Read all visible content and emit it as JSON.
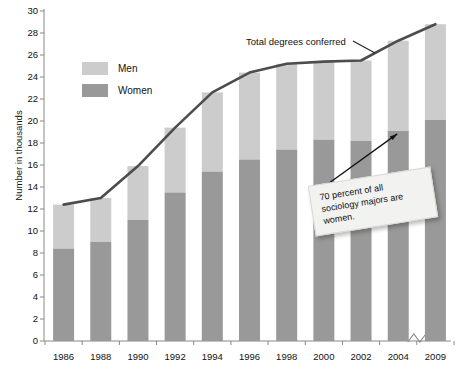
{
  "chart_data": {
    "type": "bar",
    "title": "",
    "subtitle": "",
    "xlabel": "",
    "ylabel": "Number in thousands",
    "categories": [
      "1986",
      "1988",
      "1990",
      "1992",
      "1994",
      "1996",
      "1998",
      "2000",
      "2002",
      "2004",
      "2009"
    ],
    "ylim": [
      0,
      30
    ],
    "ytick_step": 2,
    "yticks": [
      "0",
      "2",
      "4",
      "6",
      "8",
      "10",
      "12",
      "14",
      "16",
      "18",
      "20",
      "22",
      "24",
      "26",
      "28",
      "30"
    ],
    "grid": false,
    "stacked": true,
    "legend_position": "upper-left-inside",
    "series": [
      {
        "name": "Women",
        "color": "#999999",
        "values": [
          8.4,
          9.0,
          11.0,
          13.5,
          15.4,
          16.5,
          17.4,
          18.3,
          18.2,
          19.1,
          20.1
        ]
      },
      {
        "name": "Men",
        "color": "#cccccc",
        "values": [
          4.0,
          4.0,
          4.9,
          5.9,
          7.2,
          7.9,
          7.8,
          7.1,
          7.3,
          8.2,
          8.7
        ]
      }
    ],
    "line_series": {
      "name": "Total degrees conferred",
      "color": "#4d4d4d",
      "values": [
        12.4,
        13.0,
        15.9,
        19.4,
        22.6,
        24.4,
        25.2,
        25.4,
        25.5,
        27.3,
        28.8
      ]
    },
    "annotations": [
      {
        "name": "total-line-label",
        "text": "Total degrees conferred"
      },
      {
        "name": "callout-note",
        "text": "70 percent of all sociology majors are women."
      }
    ],
    "axis_break": {
      "between": [
        "2004",
        "2009"
      ],
      "axis": "x"
    }
  },
  "legend": {
    "items": [
      {
        "label": "Men",
        "color": "#cccccc"
      },
      {
        "label": "Women",
        "color": "#999999"
      }
    ]
  }
}
